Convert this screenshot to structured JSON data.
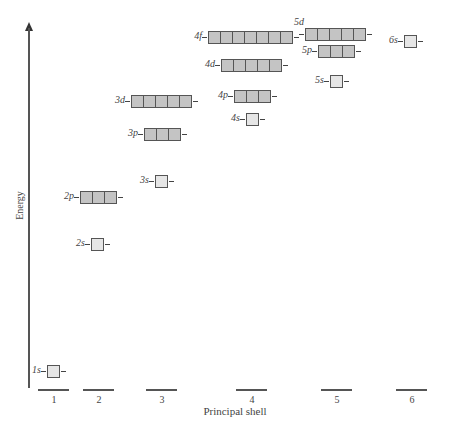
{
  "axes": {
    "ylabel": "Energy",
    "xlabel": "Principal shell"
  },
  "shells": [
    {
      "label": "1",
      "x": 38
    },
    {
      "label": "2",
      "x": 83
    },
    {
      "label": "3",
      "x": 146
    },
    {
      "label": "4",
      "x": 236
    },
    {
      "label": "5",
      "x": 321
    },
    {
      "label": "6",
      "x": 396
    }
  ],
  "colors": {
    "s_fill": "#e6e6e6",
    "pdf_fill": "#c4c4c4",
    "line": "#555555"
  },
  "orbitals": [
    {
      "name": "1s",
      "label": "1s",
      "x": 47,
      "y": 365,
      "count": 1,
      "type": "s"
    },
    {
      "name": "2s",
      "label": "2s",
      "x": 91,
      "y": 238,
      "count": 1,
      "type": "s"
    },
    {
      "name": "2p",
      "label": "2p",
      "x": 80,
      "y": 191,
      "count": 3,
      "type": "p"
    },
    {
      "name": "3s",
      "label": "3s",
      "x": 155,
      "y": 175,
      "count": 1,
      "type": "s"
    },
    {
      "name": "3p",
      "label": "3p",
      "x": 144,
      "y": 128,
      "count": 3,
      "type": "p"
    },
    {
      "name": "3d",
      "label": "3d",
      "x": 131,
      "y": 95,
      "count": 5,
      "type": "d"
    },
    {
      "name": "4s",
      "label": "4s",
      "x": 246,
      "y": 113,
      "count": 1,
      "type": "s"
    },
    {
      "name": "4p",
      "label": "4p",
      "x": 234,
      "y": 90,
      "count": 3,
      "type": "p"
    },
    {
      "name": "4d",
      "label": "4d",
      "x": 221,
      "y": 59,
      "count": 5,
      "type": "d"
    },
    {
      "name": "4f",
      "label": "4f",
      "x": 208,
      "y": 31,
      "count": 7,
      "type": "f"
    },
    {
      "name": "5s",
      "label": "5s",
      "x": 330,
      "y": 75,
      "count": 1,
      "type": "s"
    },
    {
      "name": "5p",
      "label": "5p",
      "x": 318,
      "y": 45,
      "count": 3,
      "type": "p"
    },
    {
      "name": "5d",
      "label": "5d",
      "x": 305,
      "y": 28,
      "count": 5,
      "type": "d",
      "label_above": true
    },
    {
      "name": "6s",
      "label": "6s",
      "x": 404,
      "y": 35,
      "count": 1,
      "type": "s"
    }
  ]
}
